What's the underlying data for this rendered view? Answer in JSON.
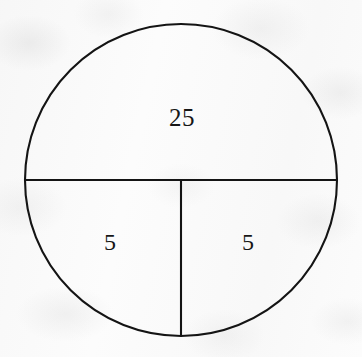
{
  "figure": {
    "kind": "geometry-diagram",
    "background_color": "#fcfcfc",
    "stroke_color": "#141414",
    "stroke_width": 2,
    "circle": {
      "center_x": 181,
      "center_y": 180,
      "radius": 156
    },
    "lines": [
      {
        "name": "horizontal-diameter",
        "x1": 25,
        "y1": 180,
        "x2": 337,
        "y2": 180
      },
      {
        "name": "vertical-radius",
        "x1": 181,
        "y1": 180,
        "x2": 181,
        "y2": 336
      }
    ],
    "regions": [
      {
        "name": "upper-semicircle",
        "label": "25",
        "label_x": 182,
        "label_y": 117
      },
      {
        "name": "lower-left-quadrant",
        "label": "5",
        "label_x": 110,
        "label_y": 242
      },
      {
        "name": "lower-right-quadrant",
        "label": "5",
        "label_x": 248,
        "label_y": 242
      }
    ]
  },
  "chart_data": {
    "type": "pie",
    "title": "",
    "subtitle": "",
    "xlabel": "",
    "ylabel": "",
    "grid": false,
    "legend": "none",
    "labels": [
      "25",
      "5",
      "5"
    ],
    "values": [
      25,
      5,
      5
    ],
    "slice_names": [
      "upper-semicircle",
      "lower-left-quadrant",
      "lower-right-quadrant"
    ],
    "slice_angles_deg": [
      180,
      90,
      90
    ],
    "slice_fill": [
      "none",
      "none",
      "none"
    ],
    "annotations": [
      "25",
      "5",
      "5"
    ]
  }
}
